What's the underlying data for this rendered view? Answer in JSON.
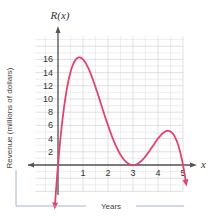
{
  "chart_data": {
    "type": "line",
    "title": "",
    "function_label": "R(x)",
    "xvar": "x",
    "xlabel": "Years",
    "ylabel": "Revenue (millions of dollars)",
    "x_ticks": [
      "1",
      "2",
      "3",
      "4",
      "5"
    ],
    "y_ticks": [
      "2",
      "4",
      "6",
      "8",
      "10",
      "12",
      "14",
      "16"
    ],
    "xlim": [
      -1,
      5.3
    ],
    "ylim": [
      -5,
      20
    ],
    "grid": true,
    "series": [
      {
        "name": "R(x)",
        "color": "#e0446f",
        "x": [
          0,
          0.25,
          0.5,
          0.8,
          1,
          1.5,
          2,
          2.5,
          3,
          3.5,
          4,
          4.4,
          4.7,
          5
        ],
        "values": [
          0,
          9.4,
          14.1,
          16.3,
          16,
          12.4,
          6,
          1.56,
          0,
          1.31,
          4,
          5.17,
          3.97,
          0
        ]
      }
    ],
    "annotations": [
      "curve arrows at both ends pointing downward",
      "axes with arrowheads"
    ]
  }
}
